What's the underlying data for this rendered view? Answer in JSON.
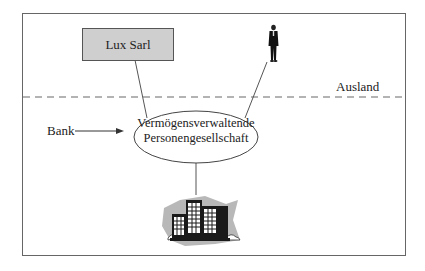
{
  "diagram": {
    "nodes": {
      "lux_sarl": {
        "label": "Lux Sarl"
      },
      "partnership": {
        "line1": "Vermögensverwaltende",
        "line2": "Personengesellschaft"
      },
      "person": {
        "icon": "businessman-icon"
      },
      "building": {
        "icon": "office-building-icon"
      }
    },
    "labels": {
      "bank": "Bank",
      "abroad": "Ausland"
    },
    "colors": {
      "box_fill": "#cfcfcf",
      "line": "#555555",
      "dashed_line": "#999999",
      "frame": "#666666"
    }
  }
}
